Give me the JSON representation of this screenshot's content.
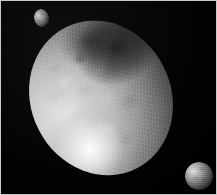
{
  "image": {
    "kind": "astronomical-photograph",
    "subject": "ellipsoidal dwarf planet with two small moons",
    "background_color": "#000000",
    "border_color": "#c9c9c9",
    "palette": "grayscale",
    "width_px": 217,
    "height_px": 195,
    "caption": ""
  },
  "scene": {
    "primary": {
      "name": "primary-body",
      "label": "Elongated ellipsoidal dwarf planet",
      "shape": "ellipse",
      "tilt_deg": -27,
      "center_px": [
        100,
        97
      ],
      "width_px": 140,
      "height_px": 158,
      "illumination": "lit from lower-left, terminator along right limb",
      "bright_spot": "lower-left sub-solar highlight",
      "dark_region": "upper-right shadowed quadrant",
      "surface": "mottled bright and dark albedo patches with horizontal scan striping",
      "brightest_value": "#ffffff",
      "darkest_value": "#030303"
    },
    "moons": [
      {
        "name": "moon-upper-left",
        "label": "Small irregular moon, upper left",
        "center_px": [
          40,
          17
        ],
        "width_px": 15,
        "height_px": 18,
        "shape": "slightly irregular oval",
        "illumination": "lit from upper-left",
        "brightness": "dim"
      },
      {
        "name": "moon-lower-right",
        "label": "Small round moon, lower right",
        "center_px": [
          198,
          175
        ],
        "width_px": 28,
        "height_px": 28,
        "shape": "round disc",
        "illumination": "lit from upper-left",
        "brightness": "moderate"
      }
    ]
  }
}
